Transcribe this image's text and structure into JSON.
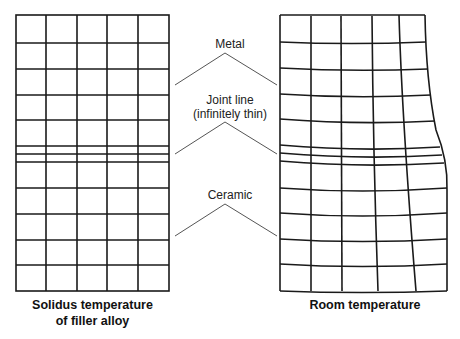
{
  "diagram": {
    "left_panel": {
      "caption_line1": "Solidus temperature",
      "caption_line2": "of filler alloy"
    },
    "right_panel": {
      "caption": "Room temperature"
    },
    "labels": {
      "metal": "Metal",
      "joint_line_1": "Joint line",
      "joint_line_2": "(infinitely thin)",
      "ceramic": "Ceramic"
    },
    "colors": {
      "grid": "#1a1a1a",
      "pointer": "#555555",
      "text": "#222222"
    }
  }
}
